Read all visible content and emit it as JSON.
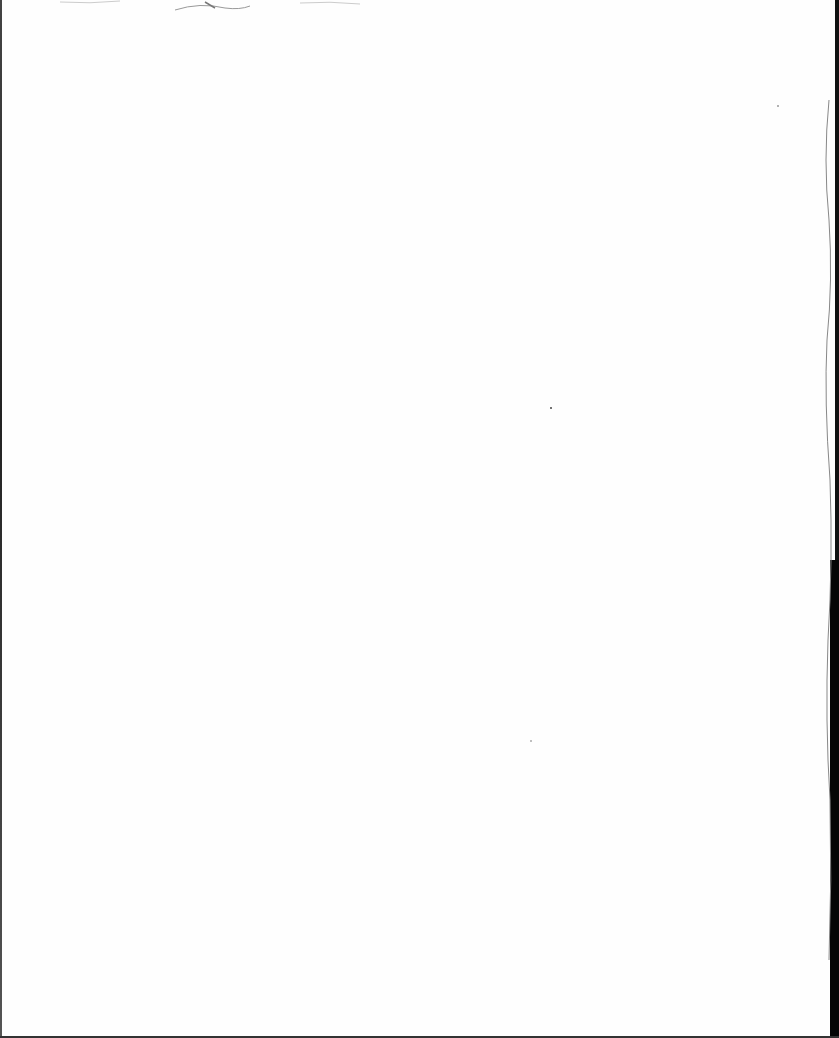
{
  "document": {
    "type": "scanned-page",
    "content": "blank",
    "text_blocks": []
  },
  "colors": {
    "paper": "#fefefe",
    "edge": "#111111"
  }
}
